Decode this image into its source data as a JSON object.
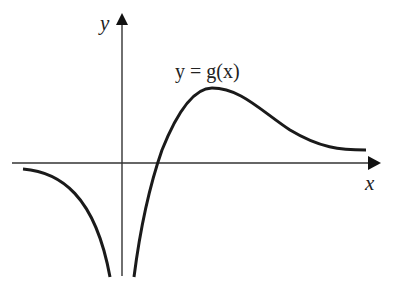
{
  "diagram": {
    "curve_label": "y = g(x)",
    "x_axis_label": "x",
    "y_axis_label": "y",
    "colors": {
      "curve": "#1a1a1a",
      "axes": "#333333",
      "background": "#ffffff"
    },
    "features": {
      "vertical_asymptote": "x = 0 (y-axis), g(x) → -∞ from both sides",
      "horizontal_asymptote": "y = 0 as x → -∞ (approached from below)",
      "x_intercept": "one positive root",
      "maximum": "single local maximum for x > 0",
      "right_tail": "decreases toward a positive value / approaches x-axis from above"
    }
  }
}
